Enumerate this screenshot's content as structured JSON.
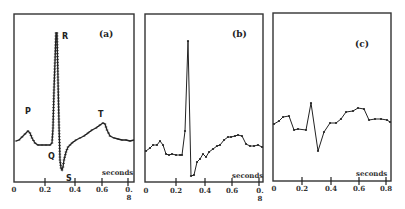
{
  "chart_data": [
    {
      "type": "line",
      "panel": "(a)",
      "title": "(a)",
      "xlabel": "seconds",
      "ylabel": "",
      "xlim": [
        0,
        0.82
      ],
      "x_ticks": [
        "0",
        "0.2",
        "0.4",
        "0.6",
        "0.8"
      ],
      "grid": false,
      "annotations": [
        "P",
        "Q",
        "R",
        "S",
        "T"
      ],
      "series": [
        {
          "name": "ECG (densely sampled)",
          "x": [
            0.0,
            0.03,
            0.06,
            0.09,
            0.11,
            0.14,
            0.17,
            0.2,
            0.23,
            0.25,
            0.26,
            0.27,
            0.28,
            0.285,
            0.3,
            0.31,
            0.32,
            0.33,
            0.35,
            0.38,
            0.42,
            0.46,
            0.5,
            0.54,
            0.58,
            0.61,
            0.63,
            0.66,
            0.7,
            0.74,
            0.78,
            0.82
          ],
          "y": [
            0.1,
            0.14,
            0.2,
            0.25,
            0.18,
            0.1,
            0.07,
            0.07,
            0.07,
            0.08,
            0.25,
            0.6,
            1.0,
            1.0,
            0.55,
            0.1,
            -0.15,
            -0.2,
            -0.05,
            0.1,
            0.14,
            0.17,
            0.2,
            0.24,
            0.28,
            0.3,
            0.26,
            0.16,
            0.13,
            0.12,
            0.11,
            0.1
          ]
        }
      ]
    },
    {
      "type": "line",
      "panel": "(b)",
      "title": "(b)",
      "xlabel": "seconds",
      "ylabel": "",
      "xlim": [
        0,
        0.82
      ],
      "x_ticks": [
        "0",
        "0.2",
        "0.4",
        "0.6",
        "0.8"
      ],
      "grid": false,
      "series": [
        {
          "name": "ECG (sub-sampled)",
          "x": [
            0.0,
            0.03,
            0.05,
            0.07,
            0.09,
            0.12,
            0.14,
            0.16,
            0.19,
            0.22,
            0.25,
            0.27,
            0.3,
            0.32,
            0.34,
            0.36,
            0.38,
            0.4,
            0.42,
            0.45,
            0.48,
            0.51,
            0.53,
            0.56,
            0.58,
            0.61,
            0.63,
            0.65,
            0.68,
            0.71,
            0.74,
            0.77,
            0.8,
            0.82
          ],
          "y": [
            0.08,
            0.13,
            0.13,
            0.15,
            0.17,
            0.1,
            0.05,
            0.06,
            0.05,
            0.05,
            0.05,
            0.3,
            1.0,
            -0.22,
            -0.2,
            -0.04,
            0.0,
            0.05,
            0.02,
            0.08,
            0.1,
            0.14,
            0.17,
            0.18,
            0.21,
            0.24,
            0.25,
            0.23,
            0.14,
            0.13,
            0.14,
            0.12,
            0.13,
            0.11
          ]
        }
      ]
    },
    {
      "type": "line",
      "panel": "(c)",
      "title": "(c)",
      "xlabel": "seconds",
      "ylabel": "",
      "xlim": [
        0,
        0.82
      ],
      "x_ticks": [
        "0",
        "0.2",
        "0.4",
        "0.6",
        "0.8"
      ],
      "grid": false,
      "series": [
        {
          "name": "ECG (coarsely sampled)",
          "x": [
            0.0,
            0.03,
            0.06,
            0.1,
            0.13,
            0.16,
            0.21,
            0.25,
            0.3,
            0.34,
            0.38,
            0.42,
            0.46,
            0.49,
            0.54,
            0.57,
            0.61,
            0.65,
            0.68,
            0.72,
            0.76,
            0.8
          ],
          "y": [
            0.1,
            0.12,
            0.16,
            0.17,
            0.04,
            0.05,
            0.04,
            0.3,
            -0.2,
            0.0,
            0.1,
            0.1,
            0.14,
            0.21,
            0.22,
            0.25,
            0.24,
            0.12,
            0.13,
            0.13,
            0.12,
            0.1
          ]
        }
      ]
    }
  ],
  "panels": {
    "a": {
      "label": "(a)",
      "unit": "seconds",
      "ticks": [
        "0",
        "0.2",
        "0.4",
        "0.6",
        "0.",
        "8"
      ],
      "waves": {
        "P": "P",
        "Q": "Q",
        "R": "R",
        "S": "S",
        "T": "T"
      }
    },
    "b": {
      "label": "(b)",
      "unit": "seconds",
      "ticks": [
        "0",
        "0.2",
        "0.4",
        "0.6",
        "0.",
        "8"
      ]
    },
    "c": {
      "label": "(c)",
      "unit": "seconds",
      "ticks": [
        "0",
        "0.2",
        "0.4",
        "0.6",
        "0.8"
      ]
    }
  },
  "traces": {
    "a": "16,141 19,140 22,137 25,134 28,131 30,133 32,138 35,143 38,145 42,145 46,145 50,145 52,143 53,128 54,90 56,33 57,33 58,80 59,125 60,160 61,168 62,170 63,167 64,160 66,152 68,147 72,143 76,140 80,138 84,136 88,133 92,130 96,128 100,125 103,123 105,124 107,130 110,136 114,138 118,139 122,140 126,140 130,141 134,140",
    "b": "146,151 150,148 153,145 157,145 160,141 163,145 166,154 169,155 172,154 176,155 180,155 182,155 185,131 188,41 191,176 194,175 197,162 200,159 203,154 206,157 209,152 213,149 217,146 220,145 224,140 228,137 231,137 235,136 238,135 242,136 246,144 250,146 254,146 258,145 262,147",
    "c": "274,124 279,121 283,117 289,116 294,130 298,129 306,130 311,103 318,151 324,132 330,123 336,123 341,119 346,112 353,111 358,108 364,109 369,120 375,119 381,119 387,120 390,122"
  }
}
